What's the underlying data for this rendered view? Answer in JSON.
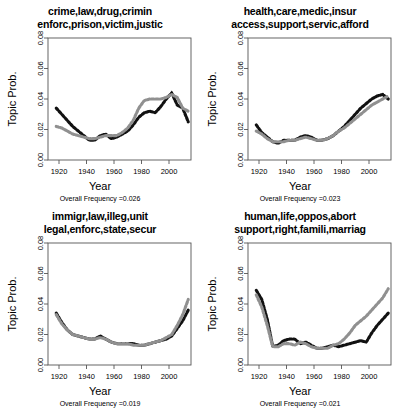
{
  "figure": {
    "type": "multi-panel-line-chart",
    "panel_count": 4,
    "shared": {
      "xlabel": "Year",
      "ylabel": "Topic Prob.",
      "xticks": [
        1920,
        1940,
        1960,
        1980,
        2000
      ],
      "yticks": [
        "0.00",
        "0.02",
        "0.04",
        "0.06",
        "0.08"
      ],
      "ytick_values": [
        0.0,
        0.02,
        0.04,
        0.06,
        0.08
      ],
      "xlim": [
        1912,
        2016
      ],
      "ylim": [
        0.0,
        0.08
      ],
      "grid": false,
      "legend": "none",
      "series_colors": {
        "black": "#111111",
        "gray": "#909090"
      },
      "freq_prefix": "Overall Frequency ="
    }
  },
  "chart_data": [
    {
      "id": "panel-crime",
      "type": "line",
      "title_line1": "crime,law,drug,crimin",
      "title_line2": "enforc,prison,victim,justic",
      "xlabel": "Year",
      "ylabel": "Topic Prob.",
      "xlim": [
        1912,
        2016
      ],
      "ylim": [
        0.0,
        0.08
      ],
      "overall_frequency": "0.026",
      "x": [
        1918,
        1922,
        1926,
        1930,
        1934,
        1938,
        1942,
        1946,
        1950,
        1954,
        1958,
        1962,
        1966,
        1970,
        1974,
        1978,
        1982,
        1986,
        1990,
        1994,
        1998,
        2002,
        2006,
        2010,
        2014
      ],
      "series": [
        {
          "name": "black",
          "color": "#111111",
          "values": [
            0.034,
            0.03,
            0.026,
            0.022,
            0.019,
            0.016,
            0.013,
            0.013,
            0.016,
            0.017,
            0.014,
            0.015,
            0.017,
            0.019,
            0.023,
            0.028,
            0.031,
            0.032,
            0.031,
            0.035,
            0.04,
            0.044,
            0.036,
            0.034,
            0.025
          ]
        },
        {
          "name": "gray",
          "color": "#909090",
          "values": [
            0.022,
            0.021,
            0.019,
            0.017,
            0.016,
            0.015,
            0.014,
            0.014,
            0.015,
            0.016,
            0.016,
            0.016,
            0.018,
            0.021,
            0.026,
            0.034,
            0.039,
            0.04,
            0.04,
            0.04,
            0.041,
            0.043,
            0.041,
            0.034,
            0.032
          ]
        }
      ]
    },
    {
      "id": "panel-health",
      "type": "line",
      "title_line1": "health,care,medic,insur",
      "title_line2": "access,support,servic,afford",
      "xlabel": "Year",
      "ylabel": "Topic Prob.",
      "xlim": [
        1912,
        2016
      ],
      "ylim": [
        0.0,
        0.08
      ],
      "overall_frequency": "0.023",
      "x": [
        1918,
        1922,
        1926,
        1930,
        1934,
        1938,
        1942,
        1946,
        1950,
        1954,
        1958,
        1962,
        1966,
        1970,
        1974,
        1978,
        1982,
        1986,
        1990,
        1994,
        1998,
        2002,
        2006,
        2010,
        2014
      ],
      "series": [
        {
          "name": "black",
          "color": "#111111",
          "values": [
            0.023,
            0.018,
            0.015,
            0.012,
            0.011,
            0.013,
            0.013,
            0.013,
            0.015,
            0.016,
            0.015,
            0.013,
            0.013,
            0.014,
            0.016,
            0.019,
            0.022,
            0.026,
            0.03,
            0.034,
            0.037,
            0.04,
            0.042,
            0.043,
            0.04
          ]
        },
        {
          "name": "gray",
          "color": "#909090",
          "values": [
            0.019,
            0.017,
            0.014,
            0.012,
            0.012,
            0.012,
            0.013,
            0.013,
            0.014,
            0.015,
            0.014,
            0.013,
            0.013,
            0.014,
            0.016,
            0.019,
            0.021,
            0.024,
            0.027,
            0.03,
            0.033,
            0.036,
            0.038,
            0.04,
            0.042
          ]
        }
      ]
    },
    {
      "id": "panel-immigration",
      "type": "line",
      "title_line1": "immigr,law,illeg,unit",
      "title_line2": "legal,enforc,state,secur",
      "xlabel": "Year",
      "ylabel": "Topic Prob.",
      "xlim": [
        1912,
        2016
      ],
      "ylim": [
        0.0,
        0.08
      ],
      "overall_frequency": "0.019",
      "x": [
        1918,
        1922,
        1926,
        1930,
        1934,
        1938,
        1942,
        1946,
        1950,
        1954,
        1958,
        1962,
        1966,
        1970,
        1974,
        1978,
        1982,
        1986,
        1990,
        1994,
        1998,
        2002,
        2006,
        2010,
        2014
      ],
      "series": [
        {
          "name": "black",
          "color": "#111111",
          "values": [
            0.034,
            0.028,
            0.023,
            0.02,
            0.019,
            0.018,
            0.017,
            0.017,
            0.019,
            0.017,
            0.015,
            0.014,
            0.014,
            0.014,
            0.014,
            0.013,
            0.013,
            0.014,
            0.015,
            0.016,
            0.017,
            0.019,
            0.024,
            0.029,
            0.036
          ]
        },
        {
          "name": "gray",
          "color": "#909090",
          "values": [
            0.033,
            0.027,
            0.023,
            0.02,
            0.019,
            0.018,
            0.017,
            0.017,
            0.018,
            0.017,
            0.015,
            0.014,
            0.014,
            0.014,
            0.013,
            0.013,
            0.013,
            0.014,
            0.015,
            0.016,
            0.018,
            0.02,
            0.026,
            0.033,
            0.043
          ]
        }
      ]
    },
    {
      "id": "panel-human-life",
      "type": "line",
      "title_line1": "human,life,oppos,abort",
      "title_line2": "support,right,famili,marriag",
      "xlabel": "Year",
      "ylabel": "Topic Prob.",
      "xlim": [
        1912,
        2016
      ],
      "ylim": [
        0.0,
        0.08
      ],
      "overall_frequency": "0.021",
      "x": [
        1918,
        1922,
        1926,
        1930,
        1934,
        1938,
        1942,
        1946,
        1950,
        1954,
        1958,
        1962,
        1966,
        1970,
        1974,
        1978,
        1982,
        1986,
        1990,
        1994,
        1998,
        2002,
        2006,
        2010,
        2014
      ],
      "series": [
        {
          "name": "black",
          "color": "#111111",
          "values": [
            0.049,
            0.043,
            0.03,
            0.012,
            0.013,
            0.016,
            0.017,
            0.017,
            0.014,
            0.015,
            0.013,
            0.011,
            0.011,
            0.012,
            0.013,
            0.012,
            0.013,
            0.014,
            0.015,
            0.016,
            0.015,
            0.021,
            0.026,
            0.03,
            0.034
          ]
        },
        {
          "name": "gray",
          "color": "#909090",
          "values": [
            0.046,
            0.038,
            0.026,
            0.012,
            0.012,
            0.014,
            0.014,
            0.013,
            0.015,
            0.014,
            0.012,
            0.011,
            0.011,
            0.011,
            0.013,
            0.014,
            0.017,
            0.021,
            0.026,
            0.029,
            0.032,
            0.036,
            0.04,
            0.044,
            0.05
          ]
        }
      ]
    }
  ]
}
